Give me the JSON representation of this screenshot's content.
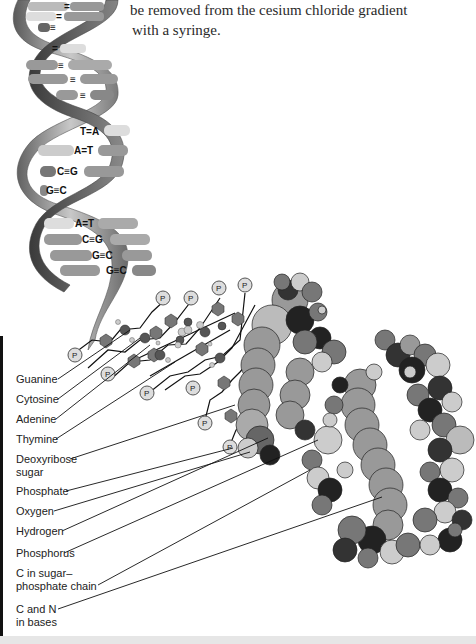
{
  "caption": {
    "lines": [
      "be removed from the cesium chloride gradient",
      "with a syringe."
    ]
  },
  "helix": {
    "base_pairs_upper": [
      "=",
      "=",
      "≡",
      "=",
      "≡",
      "≡",
      "≡"
    ],
    "base_pairs_labeled": [
      "T=A",
      "A=T",
      "C≡G",
      "G≡C",
      "A=T",
      "C≡G",
      "G≡C",
      "G≡C"
    ]
  },
  "phosphate_symbol": "P",
  "labels": [
    {
      "text": "Guanine"
    },
    {
      "text": "Cytosine"
    },
    {
      "text": "Adenine"
    },
    {
      "text": "Thymine"
    },
    {
      "text": "Deoxyribose\nsugar"
    },
    {
      "text": "Phosphate"
    },
    {
      "text": "Oxygen"
    },
    {
      "text": "Hydrogen"
    },
    {
      "text": "Phosphorus"
    },
    {
      "text": "C in sugar–\nphosphate chain"
    },
    {
      "text": "C and N\nin bases"
    }
  ],
  "colors": {
    "ribbon_dark": "#4a4a4a",
    "ribbon_light": "#b8b8b8",
    "base_light": "#d8d8d8",
    "base_mid": "#8a8a8a",
    "atom_dark": "#2b2b2b",
    "atom_mid": "#7a7a7a",
    "atom_light": "#c8c8c8",
    "phosphate_fill": "#dcdcdc"
  }
}
